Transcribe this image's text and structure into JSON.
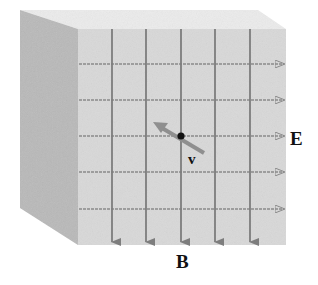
{
  "diagram": {
    "labels": {
      "electric_field": "E",
      "magnetic_field": "B",
      "velocity": "v"
    },
    "colors": {
      "front_face": "#d9d9d9",
      "side_face": "#b9b9b9",
      "top_face": "#ececec",
      "b_field_line": "#7d7d7d",
      "e_field_line": "#8a8a8a",
      "velocity_arrow": "#8f8f8f",
      "particle": "#111111",
      "text": "#111111"
    },
    "field_lines": {
      "b_field_count": 5,
      "b_field_direction": "down",
      "e_field_count": 5,
      "e_field_direction": "right"
    },
    "particle": {
      "velocity_direction": "up-left"
    }
  }
}
